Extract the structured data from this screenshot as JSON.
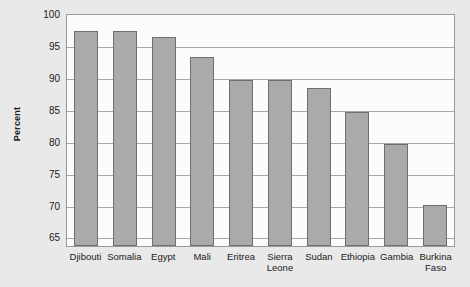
{
  "chart_data": {
    "type": "bar",
    "title": "",
    "xlabel": "",
    "ylabel": "Percent",
    "ylim": [
      63.5,
      100
    ],
    "yticks": [
      65,
      70,
      75,
      80,
      85,
      90,
      95,
      100
    ],
    "ytick_labels": [
      "65",
      "70",
      "75",
      "80",
      "85",
      "90",
      "95",
      "100"
    ],
    "grid": true,
    "legend": "none",
    "categories": [
      "Djibouti",
      "Somalia",
      "Egypt",
      "Mali",
      "Eritrea",
      "Sierra\nLeone",
      "Sudan",
      "Ethiopia",
      "Gambia",
      "Burkina\nFaso"
    ],
    "values": [
      97.2,
      97.2,
      96.3,
      93.1,
      89.5,
      89.5,
      88.2,
      84.5,
      79.5,
      69.9
    ],
    "bar_color": "#aaaaaa",
    "bar_border_color": "#6f6f6f",
    "plot_background": "#fcfcfc",
    "figure_background": "#e9e9e9",
    "gridline_color": "#a9a9a9"
  }
}
